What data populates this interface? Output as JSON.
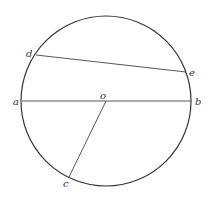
{
  "diagram": {
    "circle": {
      "cx": 106,
      "cy": 101,
      "r": 85,
      "stroke": "#333333"
    },
    "points": {
      "a": {
        "label": "a",
        "x": 22,
        "y": 101
      },
      "b": {
        "label": "b",
        "x": 191,
        "y": 101
      },
      "o": {
        "label": "o",
        "x": 106,
        "y": 101
      },
      "c": {
        "label": "c",
        "x": 69,
        "y": 177
      },
      "d": {
        "label": "d",
        "x": 36,
        "y": 55
      },
      "e": {
        "label": "e",
        "x": 186,
        "y": 72
      }
    },
    "segments": [
      {
        "from": "a",
        "to": "b"
      },
      {
        "from": "d",
        "to": "e"
      },
      {
        "from": "o",
        "to": "c"
      }
    ]
  }
}
